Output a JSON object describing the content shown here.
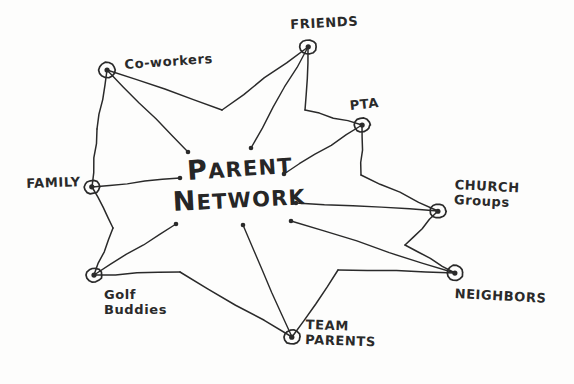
{
  "diagram": {
    "kind": "hand-drawn-mind-map",
    "title_line1": "ARENT",
    "title_line1_cap": "P",
    "title_line2": "ETWORK",
    "title_line2_cap": "N",
    "full_title": "PARENT NETWORK",
    "ink_color": "#2a2a2a",
    "paper_color": "#fdfdfc",
    "center": {
      "x": 236,
      "y": 185
    },
    "nodes": [
      {
        "id": "co-workers",
        "label": "Co-workers",
        "x": 107,
        "y": 70,
        "label_x": 124,
        "label_y": 58,
        "label_rotate": -4,
        "spoke_end_x": 188,
        "spoke_end_y": 152,
        "valley_x": 222,
        "valley_y": 110
      },
      {
        "id": "friends",
        "label": "FRIENDS",
        "x": 308,
        "y": 47,
        "label_x": 290,
        "label_y": 18,
        "label_rotate": -3,
        "spoke_end_x": 251,
        "spoke_end_y": 148,
        "valley_x": 305,
        "valley_y": 110
      },
      {
        "id": "pta",
        "label": "PTA",
        "x": 362,
        "y": 125,
        "label_x": 349,
        "label_y": 99,
        "label_rotate": -6,
        "spoke_end_x": 284,
        "spoke_end_y": 174,
        "valley_x": 361,
        "valley_y": 175
      },
      {
        "id": "church-groups",
        "label": "CHURCH\nGroups",
        "x": 438,
        "y": 211,
        "label_x": 455,
        "label_y": 178,
        "label_rotate": 3,
        "spoke_end_x": 296,
        "spoke_end_y": 203,
        "valley_x": 405,
        "valley_y": 245
      },
      {
        "id": "neighbors",
        "label": "NEIGHBORS",
        "x": 455,
        "y": 273,
        "label_x": 455,
        "label_y": 287,
        "label_rotate": 3,
        "spoke_end_x": 291,
        "spoke_end_y": 221,
        "valley_x": 338,
        "valley_y": 270
      },
      {
        "id": "team-parents",
        "label": "TEAM\nPARENTS",
        "x": 292,
        "y": 337,
        "label_x": 306,
        "label_y": 318,
        "label_rotate": 2,
        "spoke_end_x": 243,
        "spoke_end_y": 225,
        "valley_x": 180,
        "valley_y": 272
      },
      {
        "id": "golf-buddies",
        "label": "Golf\nBuddies",
        "x": 94,
        "y": 275,
        "label_x": 104,
        "label_y": 288,
        "label_rotate": 0,
        "spoke_end_x": 176,
        "spoke_end_y": 224,
        "valley_x": 113,
        "valley_y": 228
      },
      {
        "id": "family",
        "label": "FAMILY",
        "x": 92,
        "y": 187,
        "label_x": 26,
        "label_y": 177,
        "label_rotate": -2,
        "spoke_end_x": 180,
        "spoke_end_y": 178,
        "valley_x": 97,
        "valley_y": 129
      }
    ]
  }
}
